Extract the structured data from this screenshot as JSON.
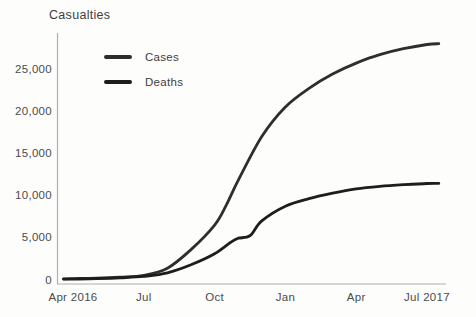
{
  "chart_data": {
    "type": "line",
    "title": "Casualties",
    "xlabel": "",
    "ylabel": "",
    "grid": false,
    "legend_position": "inside-top-left",
    "background_color": "#fdfdfc",
    "axis_color": "#b0b0b0",
    "title_color": "#3d3d3d",
    "tick_text_color": "#4b4b4b",
    "ylim": [
      0,
      25000
    ],
    "x_range": [
      "Apr 2016",
      "Jul 2017"
    ],
    "xticks": [
      {
        "label": "Apr 2016",
        "month": 0
      },
      {
        "label": "Jul",
        "month": 3
      },
      {
        "label": "Oct",
        "month": 6
      },
      {
        "label": "Jan",
        "month": 9
      },
      {
        "label": "Apr",
        "month": 12
      },
      {
        "label": "Jul 2017",
        "month": 15
      }
    ],
    "yticks": [
      {
        "label": "0",
        "value": 0
      },
      {
        "label": "5,000",
        "value": 5000
      },
      {
        "label": "10,000",
        "value": 10000
      },
      {
        "label": "15,000",
        "value": 15000
      },
      {
        "label": "20,000",
        "value": 20000
      },
      {
        "label": "25,000",
        "value": 25000
      }
    ],
    "series": [
      {
        "name": "Cases",
        "color": "#2e2e2e",
        "points": [
          [
            -0.4,
            130
          ],
          [
            0,
            160
          ],
          [
            1,
            210
          ],
          [
            2,
            330
          ],
          [
            3,
            560
          ],
          [
            4,
            1400
          ],
          [
            5,
            3600
          ],
          [
            6,
            6500
          ],
          [
            6.5,
            8900
          ],
          [
            7,
            11800
          ],
          [
            8,
            17000
          ],
          [
            9,
            20500
          ],
          [
            10,
            22700
          ],
          [
            11,
            24400
          ],
          [
            12,
            25700
          ],
          [
            13,
            26700
          ],
          [
            14,
            27400
          ],
          [
            15,
            27900
          ],
          [
            15.5,
            28000
          ]
        ]
      },
      {
        "name": "Deaths",
        "color": "#1d1d1d",
        "points": [
          [
            -0.4,
            90
          ],
          [
            0,
            110
          ],
          [
            1,
            160
          ],
          [
            2,
            260
          ],
          [
            3,
            430
          ],
          [
            4,
            850
          ],
          [
            5,
            1800
          ],
          [
            6,
            3100
          ],
          [
            6.7,
            4500
          ],
          [
            7,
            4950
          ],
          [
            7.5,
            5250
          ],
          [
            8,
            7000
          ],
          [
            9,
            8750
          ],
          [
            10,
            9650
          ],
          [
            11,
            10300
          ],
          [
            12,
            10800
          ],
          [
            13,
            11100
          ],
          [
            14,
            11300
          ],
          [
            15,
            11430
          ],
          [
            15.5,
            11450
          ]
        ]
      }
    ]
  }
}
